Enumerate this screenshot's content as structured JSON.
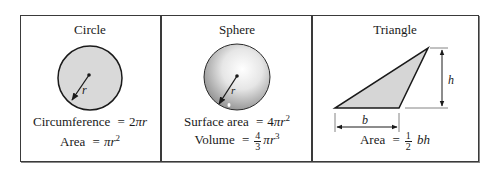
{
  "panels": [
    {
      "title": "Circle",
      "radius_label": "r",
      "formulas": {
        "line1": {
          "label": "Circumference",
          "eq": "=",
          "coef": "2",
          "pi": "π",
          "var": "r"
        },
        "line2": {
          "label": "Area",
          "eq": "=",
          "pi": "π",
          "var": "r",
          "exp": "2"
        }
      }
    },
    {
      "title": "Sphere",
      "radius_label": "r",
      "formulas": {
        "line1": {
          "label": "Surface area",
          "eq": "=",
          "coef": "4",
          "pi": "π",
          "var": "r",
          "exp": "2"
        },
        "line2": {
          "label": "Volume",
          "eq": "=",
          "num": "4",
          "den": "3",
          "pi": "π",
          "var": "r",
          "exp": "3"
        }
      }
    },
    {
      "title": "Triangle",
      "base_label": "b",
      "height_label": "h",
      "formulas": {
        "line1": {
          "label": "Area",
          "eq": "=",
          "num": "1",
          "den": "2",
          "vars": "bh"
        }
      }
    }
  ],
  "colors": {
    "border": "#3a3a3a",
    "circle_fill": "#d9d9d9",
    "sphere_highlight": "#ffffff",
    "sphere_shadow": "#8c8c8c",
    "triangle_fill": "#d6d6d6"
  }
}
